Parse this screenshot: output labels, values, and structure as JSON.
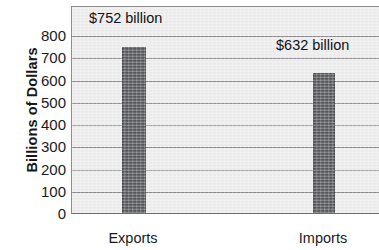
{
  "chart_data": {
    "type": "bar",
    "title": "",
    "xlabel": "",
    "ylabel": "Billions of Dollars",
    "categories": [
      "Exports",
      "Imports"
    ],
    "values": [
      752,
      632
    ],
    "value_labels": [
      "$752 billion",
      "$632 billion"
    ],
    "ylim": [
      0,
      800
    ],
    "y_ticks": [
      800,
      700,
      600,
      500,
      400,
      300,
      200,
      100,
      0
    ],
    "y_tick_labels": [
      "800",
      "700",
      "600",
      "500",
      "400",
      "300",
      "200",
      "100",
      "0"
    ],
    "grid": true,
    "legend": "none",
    "colors": {
      "bar": "#55565a",
      "plot_background": "#ececec",
      "gridline": "#8a8a8c",
      "axis": "#6e6e70",
      "text": "#1a1a1c"
    }
  }
}
